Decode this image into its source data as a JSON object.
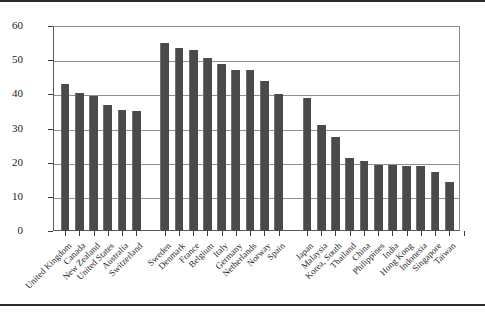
{
  "figure": {
    "background_color": "#ffffff",
    "bar_color": "#4a4a4a",
    "grid_color": "#8f8f8f",
    "axis_color": "#3a3a3a"
  },
  "chart_data": {
    "type": "bar",
    "title": "",
    "subtitle": "",
    "xlabel": "",
    "ylabel": "",
    "ylim": [
      0,
      60
    ],
    "yticks": [
      0,
      10,
      20,
      30,
      40,
      50,
      60
    ],
    "ytick_labels": [
      "0",
      "10",
      "20",
      "30",
      "40",
      "50",
      "60"
    ],
    "grid": true,
    "grid_axis": "y",
    "legend": false,
    "legend_position": "none",
    "orientation": "vertical",
    "group_gaps_after": [
      "Switzerland",
      "Spain"
    ],
    "categories": [
      "United Kingdom",
      "Canada",
      "New Zealand",
      "United States",
      "Australia",
      "Switzerland",
      "Sweden",
      "Denmark",
      "France",
      "Belgium",
      "Italy",
      "Germany",
      "Netherlands",
      "Norway",
      "Spain",
      "Japan",
      "Malaysia",
      "Korea, South",
      "Thailand",
      "China",
      "Philippines",
      "India",
      "Hong Kong",
      "Indonesia",
      "Singapore",
      "Taiwan"
    ],
    "values": [
      43.0,
      40.5,
      39.5,
      37.0,
      35.5,
      35.0,
      55.0,
      53.5,
      53.0,
      50.5,
      49.0,
      47.0,
      47.0,
      44.0,
      40.0,
      39.0,
      31.0,
      27.5,
      21.5,
      20.5,
      19.3,
      19.3,
      19.0,
      19.0,
      17.3,
      14.3
    ]
  }
}
